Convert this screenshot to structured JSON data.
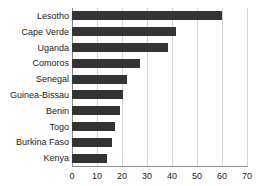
{
  "chart_data": {
    "type": "bar",
    "orientation": "horizontal",
    "title": "",
    "subtitle": "",
    "xlabel": "",
    "ylabel": "",
    "categories": [
      "Lesotho",
      "Cape Verde",
      "Uganda",
      "Comoros",
      "Senegal",
      "Guinea-Bissau",
      "Benin",
      "Togo",
      "Burkina Faso",
      "Kenya"
    ],
    "values": [
      60,
      41.5,
      38.5,
      27,
      22,
      20.5,
      19,
      17,
      16,
      14
    ],
    "xlim": [
      0,
      70
    ],
    "xticks": [
      0,
      10,
      20,
      30,
      40,
      50,
      60,
      70
    ],
    "xtick_labels": [
      "0",
      "10",
      "20",
      "30",
      "40",
      "50",
      "60",
      "70"
    ],
    "grid": "vertical",
    "legend": "none",
    "bar_color": "#333333",
    "gridline_color": "#d4d4d4",
    "axis_color": "#8c8c8c",
    "background_color": "#ffffff"
  }
}
